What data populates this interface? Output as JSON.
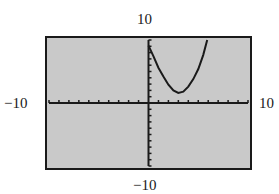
{
  "chart_data": {
    "type": "line",
    "title": "",
    "xlabel": "",
    "ylabel": "",
    "xlim": [
      -10,
      10
    ],
    "ylim": [
      -10,
      10
    ],
    "x_scale": 1,
    "y_scale": 1,
    "grid": false,
    "legend": null,
    "window_labels": {
      "xmin": "−10",
      "xmax": "10",
      "ymin": "−10",
      "ymax": "10"
    },
    "series": [
      {
        "name": "curve",
        "description": "Upward-opening parabola, vertex near (3, 1.5), y-intercept near 9",
        "x": [
          0,
          0.5,
          1,
          1.5,
          2,
          2.5,
          3,
          3.5,
          4,
          4.5,
          5,
          5.5,
          5.9
        ],
        "y": [
          9.1,
          7.4,
          5.6,
          4.2,
          2.9,
          2.0,
          1.6,
          1.8,
          2.6,
          3.8,
          5.4,
          7.6,
          10
        ]
      }
    ]
  },
  "colors": {
    "background": "#ffffff",
    "screen": "#c9c9c9",
    "frame": "#1a1a1a",
    "axes": "#1a1a1a",
    "curve": "#1a1a1a"
  }
}
